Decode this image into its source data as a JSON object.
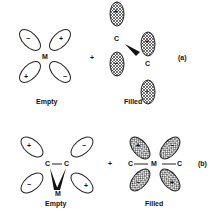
{
  "panel_a": {
    "tag": "(a)",
    "left": {
      "center": "M",
      "label": "Empty",
      "signs": [
        "−",
        "+",
        "+",
        "−"
      ]
    },
    "operator": "+",
    "right": {
      "atoms": [
        "C",
        "C"
      ],
      "label": "Filled",
      "signs": [
        "+",
        "−",
        "+",
        "−"
      ]
    }
  },
  "panel_b": {
    "tag": "(b)",
    "left": {
      "atoms": [
        "C",
        "C",
        "M"
      ],
      "label": "Empty",
      "signs": [
        "+",
        "−",
        "−",
        "+"
      ]
    },
    "operator": "+",
    "right": {
      "atoms": [
        "C",
        "M",
        "C"
      ],
      "label": "Filled",
      "signs": [
        "+",
        "−",
        "−",
        "+"
      ]
    }
  }
}
